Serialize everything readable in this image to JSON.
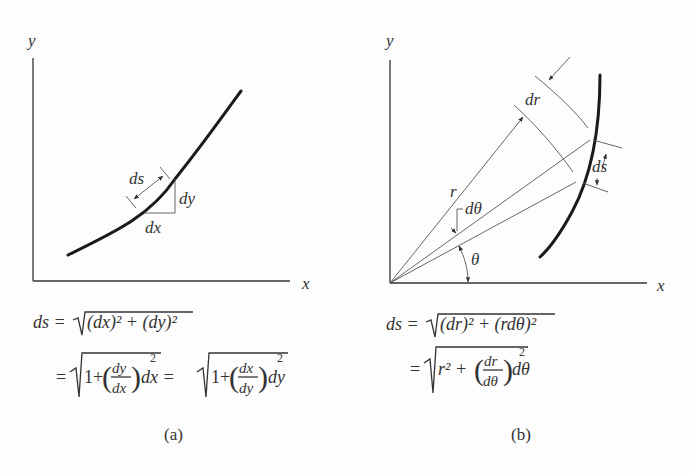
{
  "panel_a": {
    "axis_y_label": "y",
    "axis_x_label": "x",
    "ds_label": "ds",
    "dx_label": "dx",
    "dy_label": "dy",
    "eq1_lhs": "ds =",
    "eq1_rad": "(dx)² + (dy)²",
    "eq2_eq": "=",
    "eq2_one": "1+",
    "eq2_frac1_num": "dy",
    "eq2_frac1_den": "dx",
    "eq2_tail1": "dx =",
    "eq2_frac2_num": "dx",
    "eq2_frac2_den": "dy",
    "eq2_tail2": "dy",
    "exp2": "2",
    "caption": "(a)"
  },
  "panel_b": {
    "axis_y_label": "y",
    "axis_x_label": "x",
    "dr_label": "dr",
    "r_label": "r",
    "dtheta_label": "dθ",
    "theta_label": "θ",
    "ds_label": "ds",
    "eq1_lhs": "ds =",
    "eq1_rad": "(dr)² + (rdθ)²",
    "eq2_eq": "=",
    "eq2_r2": "r² +",
    "eq2_frac_num": "dr",
    "eq2_frac_den": "dθ",
    "eq2_tail": "dθ",
    "exp2": "2",
    "caption": "(b)"
  }
}
